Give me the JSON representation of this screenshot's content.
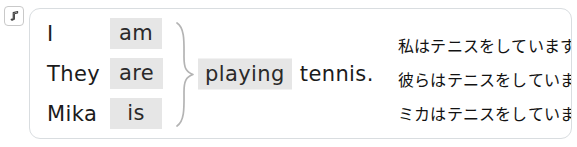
{
  "audio": {
    "icon": "music-note-icon",
    "label": "Play audio"
  },
  "card": {
    "predicate": {
      "verb": "playing",
      "object": "tennis.",
      "highlight_color": "#e6e6e6"
    },
    "brace": {
      "icon": "right-curly-brace",
      "color": "#b0b0b0"
    },
    "rows": [
      {
        "subject": "I",
        "be_verb": "am",
        "translation": "私はテニスをしています。"
      },
      {
        "subject": "They",
        "be_verb": "are",
        "translation": "彼らはテニスをしています。"
      },
      {
        "subject": "Mika",
        "be_verb": "is",
        "translation": "ミカはテニスをしています。"
      }
    ]
  },
  "colors": {
    "highlight": "#e6e6e6",
    "card_border": "#d9dde0",
    "text": "#1b1b1b",
    "brace": "#b0b0b0"
  }
}
